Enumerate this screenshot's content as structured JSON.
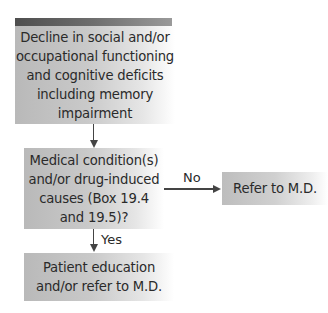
{
  "diagram": {
    "type": "flowchart",
    "nodes": {
      "start": {
        "lines": [
          "Decline in social and/or",
          "occupational functioning",
          "and cognitive deficits",
          "including memory",
          "impairment"
        ]
      },
      "decision": {
        "lines": [
          "Medical condition(s)",
          "and/or drug-induced",
          "causes (Box 19.4",
          "and 19.5)?"
        ]
      },
      "refer_no": {
        "lines": [
          "Refer to M.D."
        ]
      },
      "yes_outcome": {
        "lines": [
          "Patient education",
          "and/or refer to M.D."
        ]
      }
    },
    "edges": {
      "no_label": "No",
      "yes_label": "Yes"
    },
    "colors": {
      "box_fill_start": "#b9b9b9",
      "box_fill_end": "#ffffff",
      "header_bar_start": "#4e4e4e",
      "header_bar_end": "#9a9a9a",
      "line": "#444444",
      "text": "#2a2a2a"
    }
  }
}
